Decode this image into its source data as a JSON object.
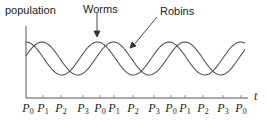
{
  "chart_data": {
    "type": "line",
    "title": "",
    "ylabel": "population",
    "xlabel": "t",
    "series": [
      {
        "name": "Worms",
        "description": "sinusoid, leads Robins",
        "peaks_at_tick": [
          "P0",
          "P0",
          "P0",
          "P0"
        ]
      },
      {
        "name": "Robins",
        "description": "sinusoid, lags Worms by about a quarter period",
        "peaks_at_tick": [
          "P1",
          "P1",
          "P1"
        ]
      }
    ],
    "x_ticks": [
      "P0",
      "P1",
      "P2",
      "P3",
      "P0",
      "P1",
      "P2",
      "P3",
      "P0",
      "P1",
      "P2",
      "P3",
      "P0"
    ],
    "annotations": [
      {
        "text": "Worms",
        "arrow_to": "Worms curve peak"
      },
      {
        "text": "Robins",
        "arrow_to": "Robins curve"
      }
    ],
    "grid": false
  },
  "labels": {
    "y_axis": "population",
    "x_axis": "t",
    "worms": "Worms",
    "robins": "Robins"
  },
  "ticks": [
    {
      "base": "P",
      "sub": "0",
      "x": 28
    },
    {
      "base": "P",
      "sub": "1",
      "x": 43
    },
    {
      "base": "P",
      "sub": "2",
      "x": 61
    },
    {
      "base": "P",
      "sub": "3",
      "x": 83
    },
    {
      "base": "P",
      "sub": "0",
      "x": 100
    },
    {
      "base": "P",
      "sub": "1",
      "x": 114
    },
    {
      "base": "P",
      "sub": "2",
      "x": 133
    },
    {
      "base": "P",
      "sub": "3",
      "x": 154
    },
    {
      "base": "P",
      "sub": "0",
      "x": 171
    },
    {
      "base": "P",
      "sub": "1",
      "x": 185
    },
    {
      "base": "P",
      "sub": "2",
      "x": 203
    },
    {
      "base": "P",
      "sub": "3",
      "x": 223
    },
    {
      "base": "P",
      "sub": "0",
      "x": 241
    }
  ]
}
